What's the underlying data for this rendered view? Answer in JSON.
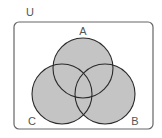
{
  "diagram": {
    "type": "venn",
    "universe_label": "U",
    "sets": [
      {
        "label": "A",
        "cx": 83,
        "cy": 68,
        "r": 30,
        "label_x": 83,
        "label_y": 35
      },
      {
        "label": "B",
        "cx": 105,
        "cy": 94,
        "r": 30,
        "label_x": 135,
        "label_y": 125
      },
      {
        "label": "C",
        "cx": 62,
        "cy": 94,
        "r": 30,
        "label_x": 32,
        "label_y": 125
      }
    ],
    "shaded": "A ∪ B ∪ C",
    "colors": {
      "fill": "#c4c4c4",
      "stroke": "#2a2a2a",
      "box_stroke": "#666666",
      "label": "#555555"
    }
  }
}
